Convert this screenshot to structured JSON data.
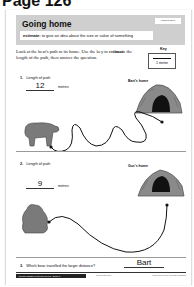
{
  "page": {
    "label": "Page 126"
  },
  "banner": {
    "title": "Going home",
    "tag": "Mathematics",
    "definition_term": "estimate:",
    "definition_text": " to give an idea about the size or value of something"
  },
  "intro": {
    "text_before": "Look at the bear's path to its home. Use the key to ",
    "keyword": "estimate",
    "text_after": " the length of the path, then answer the question."
  },
  "key": {
    "label": "Key",
    "unit": "1 metre"
  },
  "questions": [
    {
      "number": "1.",
      "prompt": "Length of path",
      "answer": "12",
      "units": "metres",
      "home_label": "Bart's home"
    },
    {
      "number": "2.",
      "prompt": "Length of path",
      "answer": "9",
      "units": "metres",
      "home_label": "Gus's home"
    },
    {
      "number": "3.",
      "prompt": "Which bear travelled the larger distance?",
      "answer": "Bart"
    }
  ],
  "footer": {
    "series": "HIGHER ORDER THINKING SKILLS - BOOK 2",
    "isbn": "9781 846541630",
    "publisher": "www.prim-ed.com  Prim-Ed Publishing"
  }
}
